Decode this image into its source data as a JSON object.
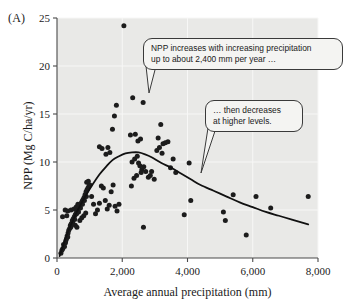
{
  "panel": {
    "label": "(A)"
  },
  "axes": {
    "x_title": "Average annual precipitation (mm)",
    "y_title": "NPP (Mg C/ha/yr)",
    "x_ticks": [
      "0",
      "2,000",
      "4,000",
      "6,000",
      "8,000"
    ],
    "y_ticks": [
      "0",
      "5",
      "10",
      "15",
      "20",
      "25"
    ]
  },
  "callouts": {
    "increase": {
      "line1": "NPP increases with increasing precipitation",
      "line2": "up to about 2,400 mm per year …"
    },
    "decrease": {
      "line1": "… then decreases",
      "line2": "at higher levels."
    }
  },
  "colors": {
    "plot_background": "#e9e9e7",
    "gridline": "#f7f7f6",
    "axis": "#4a4a4a",
    "point": "#1c1c1c",
    "curve": "#111111",
    "callout_fill": "#f4f4f2",
    "callout_border": "#3a3a3a"
  },
  "chart_data": {
    "type": "scatter",
    "title": "",
    "xlabel": "Average annual precipitation (mm)",
    "ylabel": "NPP (Mg C/ha/yr)",
    "xlim": [
      0,
      8000
    ],
    "ylim": [
      0,
      25
    ],
    "xticks": [
      0,
      2000,
      4000,
      6000,
      8000
    ],
    "yticks": [
      0,
      5,
      10,
      15,
      20,
      25
    ],
    "grid": true,
    "legend": null,
    "annotations": [
      {
        "text": "NPP increases with increasing precipitation up to about 2,400 mm per year …",
        "points_to_x": 2800,
        "points_to_y": 14.0
      },
      {
        "text": "… then decreases at higher levels.",
        "points_to_x": 4400,
        "points_to_y": 9.0
      }
    ],
    "series": [
      {
        "name": "Forest sites",
        "marker": "filled-circle",
        "points": [
          [
            120,
            0.5
          ],
          [
            180,
            1.0
          ],
          [
            200,
            1.4
          ],
          [
            150,
            0.8
          ],
          [
            260,
            1.6
          ],
          [
            290,
            2.0
          ],
          [
            230,
            1.2
          ],
          [
            310,
            2.3
          ],
          [
            340,
            2.6
          ],
          [
            270,
            1.8
          ],
          [
            360,
            2.9
          ],
          [
            390,
            3.1
          ],
          [
            330,
            2.2
          ],
          [
            410,
            3.4
          ],
          [
            300,
            4.4
          ],
          [
            440,
            3.6
          ],
          [
            470,
            3.9
          ],
          [
            420,
            3.2
          ],
          [
            500,
            4.1
          ],
          [
            530,
            4.3
          ],
          [
            480,
            3.7
          ],
          [
            560,
            4.5
          ],
          [
            590,
            4.7
          ],
          [
            540,
            4.0
          ],
          [
            620,
            4.9
          ],
          [
            650,
            5.1
          ],
          [
            600,
            4.6
          ],
          [
            680,
            5.3
          ],
          [
            710,
            5.5
          ],
          [
            660,
            4.8
          ],
          [
            740,
            5.7
          ],
          [
            770,
            5.9
          ],
          [
            720,
            5.2
          ],
          [
            800,
            6.1
          ],
          [
            830,
            6.3
          ],
          [
            780,
            5.6
          ],
          [
            860,
            6.6
          ],
          [
            890,
            6.9
          ],
          [
            840,
            6.0
          ],
          [
            920,
            7.1
          ],
          [
            950,
            7.3
          ],
          [
            900,
            6.4
          ],
          [
            980,
            7.5
          ],
          [
            640,
            5.6
          ],
          [
            560,
            3.4
          ],
          [
            610,
            3.2
          ],
          [
            700,
            3.9
          ],
          [
            760,
            4.2
          ],
          [
            820,
            4.4
          ],
          [
            880,
            4.7
          ],
          [
            250,
            5.0
          ],
          [
            330,
            4.9
          ],
          [
            170,
            4.3
          ],
          [
            430,
            5.0
          ],
          [
            520,
            5.1
          ],
          [
            590,
            5.3
          ],
          [
            660,
            5.4
          ],
          [
            910,
            7.9
          ],
          [
            960,
            8.0
          ],
          [
            1010,
            7.6
          ],
          [
            1060,
            6.4
          ],
          [
            1120,
            5.6
          ],
          [
            1180,
            4.6
          ],
          [
            1240,
            5.0
          ],
          [
            1300,
            5.7
          ],
          [
            1360,
            7.5
          ],
          [
            1420,
            7.3
          ],
          [
            1480,
            6.0
          ],
          [
            1540,
            5.1
          ],
          [
            1600,
            5.5
          ],
          [
            1660,
            6.9
          ],
          [
            1720,
            7.6
          ],
          [
            1780,
            5.4
          ],
          [
            1840,
            4.9
          ],
          [
            1900,
            5.6
          ],
          [
            1500,
            10.8
          ],
          [
            1560,
            11.5
          ],
          [
            1620,
            11.0
          ],
          [
            1300,
            11.6
          ],
          [
            1380,
            11.4
          ],
          [
            1700,
            13.4
          ],
          [
            1760,
            14.8
          ],
          [
            1820,
            15.9
          ],
          [
            2050,
            24.2
          ],
          [
            2250,
            12.8
          ],
          [
            2320,
            16.7
          ],
          [
            2400,
            12.9
          ],
          [
            2480,
            12.2
          ],
          [
            2560,
            12.4
          ],
          [
            2640,
            16.2
          ],
          [
            2300,
            10.0
          ],
          [
            2380,
            10.3
          ],
          [
            2460,
            10.6
          ],
          [
            2540,
            9.6
          ],
          [
            2600,
            9.2
          ],
          [
            2660,
            9.5
          ],
          [
            2720,
            9.0
          ],
          [
            2500,
            9.9
          ],
          [
            2580,
            8.9
          ],
          [
            2440,
            8.6
          ],
          [
            2360,
            8.3
          ],
          [
            2280,
            7.5
          ],
          [
            2800,
            8.4
          ],
          [
            2860,
            8.6
          ],
          [
            2900,
            9.0
          ],
          [
            3100,
            12.5
          ],
          [
            3180,
            13.9
          ],
          [
            3250,
            11.9
          ],
          [
            3320,
            12.0
          ],
          [
            3400,
            12.1
          ],
          [
            3060,
            11.2
          ],
          [
            3140,
            11.5
          ],
          [
            3220,
            10.9
          ],
          [
            2980,
            8.2
          ],
          [
            3480,
            9.4
          ],
          [
            3560,
            10.3
          ],
          [
            3640,
            8.9
          ],
          [
            4100,
            6.0
          ],
          [
            4050,
            9.9
          ],
          [
            5100,
            4.8
          ],
          [
            5160,
            3.9
          ],
          [
            5400,
            6.6
          ],
          [
            5800,
            2.4
          ],
          [
            6100,
            6.4
          ],
          [
            6550,
            5.2
          ],
          [
            7700,
            6.4
          ],
          [
            3900,
            4.5
          ],
          [
            2650,
            3.2
          ]
        ]
      }
    ],
    "fitted_curve": {
      "name": "Quadratic/hump fit",
      "peak_x": 2400,
      "peak_y": 11.0,
      "points": [
        [
          80,
          0.2
        ],
        [
          300,
          2.4
        ],
        [
          500,
          4.0
        ],
        [
          700,
          5.4
        ],
        [
          900,
          6.6
        ],
        [
          1100,
          7.7
        ],
        [
          1300,
          8.7
        ],
        [
          1500,
          9.5
        ],
        [
          1700,
          10.2
        ],
        [
          1900,
          10.6
        ],
        [
          2100,
          10.9
        ],
        [
          2300,
          11.0
        ],
        [
          2500,
          11.0
        ],
        [
          2700,
          10.8
        ],
        [
          2900,
          10.5
        ],
        [
          3200,
          9.9
        ],
        [
          3500,
          9.4
        ],
        [
          3800,
          8.8
        ],
        [
          4100,
          8.2
        ],
        [
          4400,
          7.6
        ],
        [
          4800,
          7.0
        ],
        [
          5200,
          6.4
        ],
        [
          5600,
          5.8
        ],
        [
          6000,
          5.3
        ],
        [
          6400,
          4.8
        ],
        [
          6800,
          4.4
        ],
        [
          7200,
          4.0
        ],
        [
          7700,
          3.5
        ]
      ]
    }
  }
}
